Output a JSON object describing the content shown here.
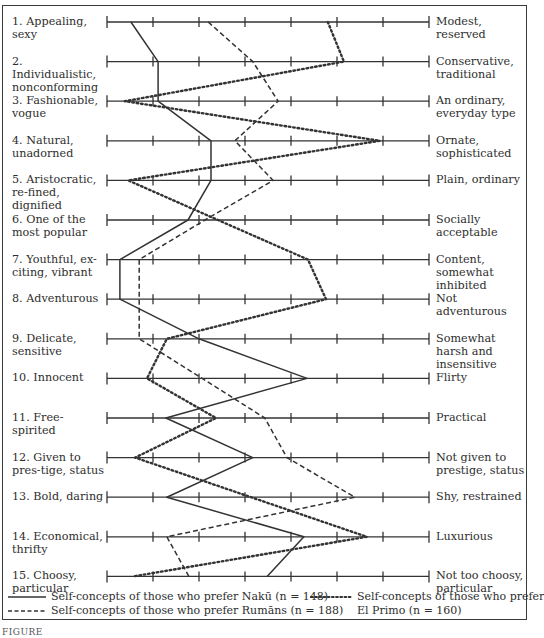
{
  "chart_data": {
    "type": "line",
    "title": "",
    "orientation": "horizontal-profile",
    "scale": {
      "min": 1,
      "max": 8,
      "ticks": [
        1,
        2,
        3,
        4,
        5,
        6,
        7,
        8
      ],
      "grid": false
    },
    "items": [
      {
        "num": "1.",
        "left": "Appealing, sexy",
        "right": "Modest, reserved"
      },
      {
        "num": "2.",
        "left": "Individualistic, nonconforming",
        "right": "Conservative, traditional"
      },
      {
        "num": "3.",
        "left": "Fashionable, vogue",
        "right": "An ordinary, everyday type"
      },
      {
        "num": "4.",
        "left": "Natural, unadorned",
        "right": "Ornate, sophisticated"
      },
      {
        "num": "5.",
        "left": "Aristocratic, re-fined, dignified",
        "right": "Plain, ordinary"
      },
      {
        "num": "6.",
        "left": "One of the most popular",
        "right": "Socially acceptable"
      },
      {
        "num": "7.",
        "left": "Youthful, ex-citing, vibrant",
        "right": "Content, somewhat inhibited"
      },
      {
        "num": "8.",
        "left": "Adventurous",
        "right": "Not adventurous"
      },
      {
        "num": "9.",
        "left": "Delicate, sensitive",
        "right": "Somewhat harsh and insensitive"
      },
      {
        "num": "10.",
        "left": "Innocent",
        "right": "Flirty"
      },
      {
        "num": "11.",
        "left": "Free-spirited",
        "right": "Practical"
      },
      {
        "num": "12.",
        "left": "Given to pres-tige, status",
        "right": "Not given to prestige, status"
      },
      {
        "num": "13.",
        "left": "Bold, daring",
        "right": "Shy, restrained"
      },
      {
        "num": "14.",
        "left": "Economical, thrifty",
        "right": "Luxurious"
      },
      {
        "num": "15.",
        "left": "Choosy, particular",
        "right": "Not too choosy, particular"
      }
    ],
    "series": [
      {
        "name": "Self-concepts of those who prefer Nakū (n = 148)",
        "style": "solid",
        "values": [
          1.52,
          2.11,
          2.11,
          3.26,
          3.26,
          2.76,
          1.28,
          1.28,
          3.0,
          5.35,
          2.28,
          4.17,
          2.3,
          5.28,
          4.48
        ]
      },
      {
        "name": "Self-concepts of those who prefer Rumāns (n = 188)",
        "style": "dashed",
        "values": [
          3.2,
          4.17,
          4.72,
          3.78,
          4.61,
          3.13,
          1.7,
          1.7,
          1.7,
          3.07,
          4.43,
          4.91,
          6.39,
          2.3,
          2.78
        ]
      },
      {
        "name": "Self-concepts of those who prefer El Primo (n = 160)",
        "style": "dotted",
        "values": [
          5.8,
          6.15,
          1.39,
          6.93,
          1.46,
          3.41,
          5.37,
          5.76,
          2.3,
          1.87,
          3.37,
          1.61,
          4.13,
          6.65,
          1.57
        ]
      }
    ],
    "legend": {
      "position": "bottom",
      "entries": [
        {
          "style": "solid",
          "text": "Self-concepts of those who prefer Nakū (n = 148)"
        },
        {
          "style": "dashed",
          "text": "Self-concepts of those who prefer Rumāns (n = 188)"
        },
        {
          "style": "dotted",
          "text": "Self-concepts of those who prefer El Primo (n = 160)"
        }
      ]
    },
    "line_color": "#333333"
  },
  "legend": {
    "naku": "Self-concepts of those who prefer Nakū (n = 148)",
    "rumans": "Self-concepts of those who prefer Rumāns (n = 188)",
    "elprimo_line1": "Self-concepts of those who prefer",
    "elprimo_line2": "El Primo (n = 160)"
  },
  "caption": "FIGURE"
}
